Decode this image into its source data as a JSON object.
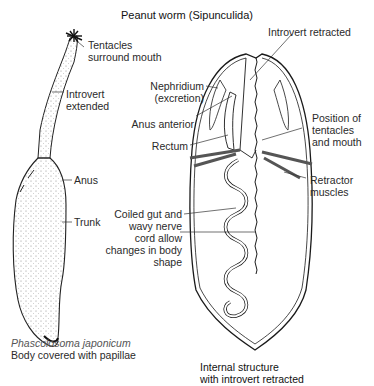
{
  "title": "Peanut worm (Sipunculida)",
  "left_figure": {
    "labels": {
      "tentacles": [
        "Tentacles",
        "surround mouth"
      ],
      "introvert": [
        "Introvert",
        "extended"
      ],
      "anus": "Anus",
      "trunk": "Trunk"
    },
    "caption": {
      "species": "Phascolosoma japonicum",
      "description": "Body covered with papillae"
    }
  },
  "right_figure": {
    "labels": {
      "introvert_retracted": "Introvert retracted",
      "nephridium": [
        "Nephridium",
        "(excretion)"
      ],
      "anus_anterior": "Anus anterior",
      "rectum": "Rectum",
      "position": [
        "Position of",
        "tentacles",
        "and mouth"
      ],
      "retractor": [
        "Retractor",
        "muscles"
      ],
      "coiled": [
        "Coiled gut and",
        "wavy nerve",
        "cord allow",
        "changes in body",
        "shape"
      ]
    },
    "caption": [
      "Internal structure",
      "with introvert retracted"
    ]
  },
  "colors": {
    "ink": "#1a1a1a",
    "text": "#2a2a2a",
    "caption_italic": "#555555",
    "background": "#ffffff"
  }
}
